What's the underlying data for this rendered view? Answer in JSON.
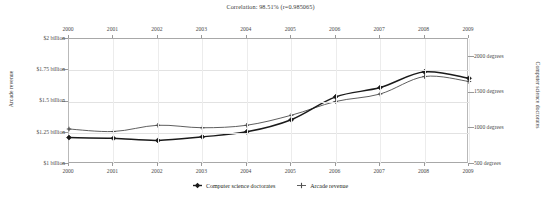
{
  "chart_title": "Correlation: 98.51% (r=0.985065)",
  "axis_titles": {
    "left": "Arcade revenue",
    "right": "Computer science doctorates"
  },
  "left_axis_ticks": [
    "$2 billion",
    "$1.75 billion",
    "$1.5 billion",
    "$1.25 billion",
    "$1 billion"
  ],
  "right_axis_ticks": [
    "2000 degrees",
    "1500 degrees",
    "1000 degrees",
    "500 degrees"
  ],
  "legend": [
    {
      "label": "Computer science doctorates",
      "marker": "filled-diamond-icon",
      "color": "#1a1a1a"
    },
    {
      "label": "Arcade revenue",
      "marker": "thin-cross-icon",
      "color": "#4d4d4d"
    }
  ],
  "chart_data": {
    "type": "line",
    "title": "Correlation: 98.51% (r=0.985065)",
    "x": [
      2000,
      2001,
      2002,
      2003,
      2004,
      2005,
      2006,
      2007,
      2008,
      2009
    ],
    "xlabel": "",
    "xtick_labels": [
      "2000",
      "2001",
      "2002",
      "2003",
      "2004",
      "2005",
      "2006",
      "2007",
      "2008",
      "2009"
    ],
    "xtick_labels_top": [
      "2000",
      "2001",
      "2002",
      "2003",
      "2004",
      "2005",
      "2006",
      "2007",
      "2008",
      "2009"
    ],
    "xlim": [
      2000,
      2009
    ],
    "grid": true,
    "legend_position": "bottom",
    "series": [
      {
        "name": "Computer science doctorates",
        "axis": "right",
        "ylabel": "Computer science doctorates",
        "ylim": [
          500,
          2250
        ],
        "ytick_values": [
          2000,
          1500,
          1000,
          500
        ],
        "ytick_labels": [
          "2000 degrees",
          "1500 degrees",
          "1000 degrees",
          "500 degrees"
        ],
        "unit": "degrees",
        "color": "#1a1a1a",
        "marker": "filled-diamond",
        "values": [
          870,
          860,
          830,
          880,
          950,
          1120,
          1440,
          1570,
          1790,
          1700
        ]
      },
      {
        "name": "Arcade revenue",
        "axis": "left",
        "ylabel": "Arcade revenue",
        "ylim": [
          1.0,
          2.0
        ],
        "ytick_values": [
          2.0,
          1.75,
          1.5,
          1.25,
          1.0
        ],
        "ytick_labels": [
          "$2 billion",
          "$1.75 billion",
          "$1.5 billion",
          "$1.25 billion",
          "$1 billion"
        ],
        "unit": "billion USD",
        "color": "#4d4d4d",
        "marker": "thin-cross",
        "values": [
          1.28,
          1.26,
          1.31,
          1.29,
          1.31,
          1.39,
          1.5,
          1.56,
          1.7,
          1.66
        ]
      }
    ]
  }
}
